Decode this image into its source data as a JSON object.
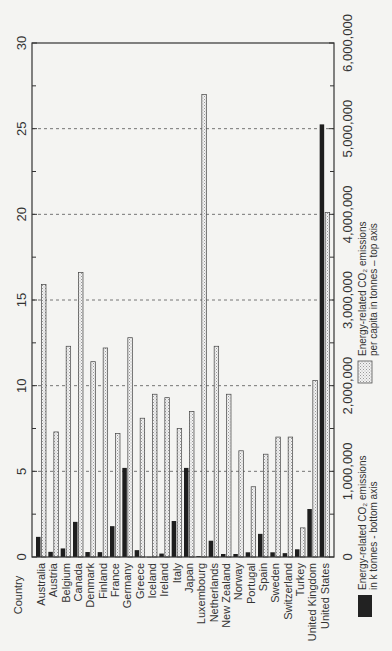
{
  "chart_data": {
    "type": "bar",
    "orientation": "rotated-90-ccw",
    "title": "",
    "xlabel": "Country",
    "categories": [
      "Australia",
      "Austria",
      "Belgium",
      "Canada",
      "Denmark",
      "Finland",
      "France",
      "Germany",
      "Greece",
      "Iceland",
      "Ireland",
      "Italy",
      "Japan",
      "Luxembourg",
      "Netherlands",
      "New Zealand",
      "Norway",
      "Portugal",
      "Spain",
      "Sweden",
      "Switzerland",
      "Turkey",
      "United Kingdom",
      "United States"
    ],
    "series": [
      {
        "name": "Energy-related CO2 emissions in k tonnes - bottom axis",
        "axis": "bottom",
        "style": "solid-black",
        "values": [
          235000,
          60000,
          100000,
          410000,
          58000,
          57000,
          360000,
          1040000,
          80000,
          2000,
          40000,
          420000,
          1040000,
          10000,
          190000,
          35000,
          35000,
          55000,
          270000,
          55000,
          45000,
          90000,
          560000,
          5050000
        ]
      },
      {
        "name": "Energy-related CO2 emissions per capita in tonnes - top axis",
        "axis": "top",
        "style": "dotted-light",
        "values": [
          15.9,
          7.3,
          12.3,
          16.6,
          11.4,
          12.2,
          7.2,
          12.8,
          8.1,
          9.5,
          9.3,
          7.5,
          8.5,
          27.0,
          12.3,
          9.5,
          6.2,
          4.1,
          6.0,
          7.0,
          7.0,
          1.7,
          10.3,
          20.1
        ]
      }
    ],
    "top_axis": {
      "range": [
        0,
        30
      ],
      "ticks": [
        "0",
        "5",
        "10",
        "15",
        "20",
        "25",
        "30"
      ]
    },
    "bottom_axis": {
      "range": [
        0,
        6000000
      ],
      "ticks": [
        "0",
        "1,000,000",
        "2,000,000",
        "3,000,000",
        "4,000,000",
        "5,000,000",
        "6,000,000"
      ]
    },
    "gridlines": [
      5,
      10,
      15,
      20,
      25
    ],
    "legend": [
      {
        "label_line1": "Energy-related CO₂ emissions",
        "label_line2": "in k tonnes - bottom axis",
        "swatch": "#222222"
      },
      {
        "label_line1": "Energy-related CO₂ emissions",
        "label_line2": "per capita in tonnes – top axis",
        "swatch": "dotted"
      }
    ]
  },
  "colors": {
    "dark_bar": "#1e1e1e",
    "light_bar_fill": "#eeeeee",
    "frame": "#333333",
    "grid": "#555555"
  }
}
